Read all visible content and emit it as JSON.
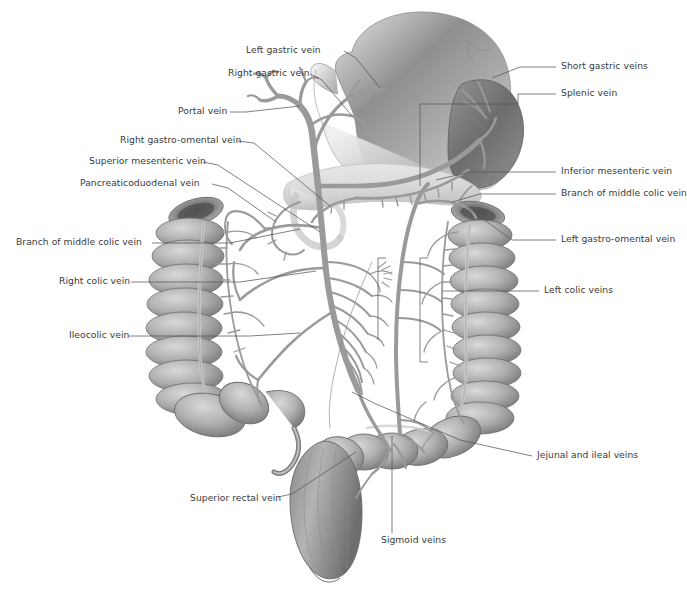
{
  "figure": {
    "background_color": "#ffffff",
    "text_color": "#3a3a3a",
    "leader_color": "#555555",
    "vessel_color": "#9a9a9a",
    "organ_light": "#d8d8d8",
    "organ_mid": "#a8a8a8",
    "organ_dark": "#6f6f6f"
  },
  "labels": {
    "left_gastric_vein": "Left gastric vein",
    "right_gastric_vein": "Right gastric vein",
    "portal_vein": "Portal vein",
    "right_gastro_omental_vein": "Right  gastro-omental vein",
    "superior_mesenteric_vein": "Superior mesenteric vein",
    "pancreaticoduodenal_vein": "Pancreaticoduodenal vein",
    "branch_middle_colic_left": "Branch of middle colic vein",
    "right_colic_vein": "Right  colic vein",
    "ileocolic_vein": "Ileocolic vein",
    "short_gastric_veins": "Short gastric veins",
    "splenic_vein": "Splenic vein",
    "inferior_mesenteric_vein": "Inferior mesenteric vein",
    "branch_middle_colic_right": "Branch of middle colic vein",
    "left_gastro_omental_vein": "Left gastro-omental vein",
    "left_colic_veins": "Left  colic veins",
    "jejunal_and_ileal_veins": "Jejunal and ileal veins",
    "superior_rectal_vein": "Superior rectal vein",
    "sigmoid_veins": "Sigmoid veins"
  },
  "label_positions": {
    "left_gastric_vein": {
      "side": "l",
      "x": 246,
      "y": 48
    },
    "right_gastric_vein": {
      "side": "l",
      "x": 228,
      "y": 70
    },
    "portal_vein": {
      "side": "l",
      "x": 178,
      "y": 111
    },
    "right_gastro_omental_vein": {
      "side": "l",
      "x": 122,
      "y": 138
    },
    "superior_mesenteric_vein": {
      "side": "l",
      "x": 92,
      "y": 159
    },
    "pancreaticoduodenal_vein": {
      "side": "l",
      "x": 82,
      "y": 181
    },
    "branch_middle_colic_left": {
      "side": "l",
      "x": 16,
      "y": 240
    },
    "right_colic_vein": {
      "side": "l",
      "x": 62,
      "y": 279
    },
    "ileocolic_vein": {
      "side": "l",
      "x": 70,
      "y": 333
    },
    "short_gastric_veins": {
      "side": "r",
      "x": 560,
      "y": 64
    },
    "splenic_vein": {
      "side": "r",
      "x": 560,
      "y": 91
    },
    "inferior_mesenteric_vein": {
      "side": "r",
      "x": 560,
      "y": 169
    },
    "branch_middle_colic_right": {
      "side": "r",
      "x": 560,
      "y": 191
    },
    "left_gastro_omental_vein": {
      "side": "r",
      "x": 560,
      "y": 237
    },
    "left_colic_veins": {
      "side": "r",
      "x": 543,
      "y": 288
    },
    "jejunal_and_ileal_veins": {
      "side": "r",
      "x": 536,
      "y": 453
    },
    "superior_rectal_vein": {
      "side": "l",
      "x": 190,
      "y": 498
    },
    "sigmoid_veins": {
      "side": "r",
      "x": 381,
      "y": 539
    }
  },
  "structures": [
    "stomach",
    "spleen",
    "pancreas",
    "duodenum",
    "ascending-colon",
    "transverse-colon",
    "descending-colon",
    "sigmoid-colon",
    "rectum",
    "cecum",
    "appendix",
    "mesenteric-vein-arcade"
  ]
}
